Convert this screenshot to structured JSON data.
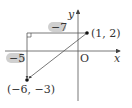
{
  "diagram": {
    "axes": {
      "x_label": "x",
      "y_label": "y",
      "origin_label": "O"
    },
    "points": [
      {
        "label": "(1, 2)",
        "x": 1,
        "y": 2
      },
      {
        "label": "(−6, −3)",
        "x": -6,
        "y": -3
      }
    ],
    "segments": {
      "horizontal_leg_label": "−7",
      "vertical_leg_label": "−5"
    },
    "colors": {
      "line": "#555555",
      "highlight": "#d0d0d0",
      "point": "#111111"
    }
  }
}
